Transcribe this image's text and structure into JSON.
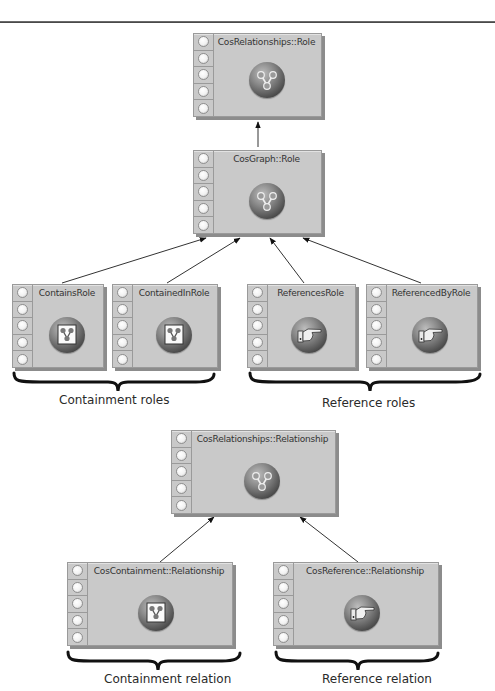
{
  "diagram": {
    "role_hierarchy": {
      "root": {
        "label": "CosRelationships::Role",
        "icon": "graph-node-icon"
      },
      "middle": {
        "label": "CosGraph::Role",
        "icon": "graph-node-icon"
      },
      "children": [
        {
          "label": "ContainsRole",
          "icon": "containment-icon",
          "group": "containment"
        },
        {
          "label": "ContainedInRole",
          "icon": "containment-icon",
          "group": "containment"
        },
        {
          "label": "ReferencesRole",
          "icon": "pointing-hand-icon",
          "group": "reference"
        },
        {
          "label": "ReferencedByRole",
          "icon": "pointing-hand-icon",
          "group": "reference"
        }
      ],
      "group_captions": {
        "containment": "Containment roles",
        "reference": "Reference roles"
      }
    },
    "relationship_hierarchy": {
      "root": {
        "label": "CosRelationships::Relationship",
        "icon": "graph-node-icon"
      },
      "children": [
        {
          "label": "CosContainment::Relationship",
          "icon": "containment-icon",
          "caption": "Containment relation"
        },
        {
          "label": "CosReference::Relationship",
          "icon": "pointing-hand-icon",
          "caption": "Reference relation"
        }
      ]
    },
    "edges": [
      {
        "from": "CosGraph::Role",
        "to": "CosRelationships::Role"
      },
      {
        "from": "ContainsRole",
        "to": "CosGraph::Role"
      },
      {
        "from": "ContainedInRole",
        "to": "CosGraph::Role"
      },
      {
        "from": "ReferencesRole",
        "to": "CosGraph::Role"
      },
      {
        "from": "ReferencedByRole",
        "to": "CosGraph::Role"
      },
      {
        "from": "CosContainment::Relationship",
        "to": "CosRelationships::Relationship"
      },
      {
        "from": "CosReference::Relationship",
        "to": "CosRelationships::Relationship"
      }
    ],
    "ports_per_node": 5
  }
}
